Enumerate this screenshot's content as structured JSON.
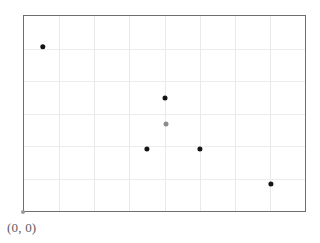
{
  "figure": {
    "origin_label": "(0, 0)",
    "background_color": "#ffffff",
    "frame_color": "#6e6e6e",
    "grid_color": "#e9e9ec",
    "origin_marker_color": "#9a9a9a"
  },
  "chart_data": {
    "type": "scatter",
    "title": "",
    "subtitle": "",
    "xlabel": "",
    "ylabel": "",
    "annotations": [
      "(0, 0)"
    ],
    "grid": true,
    "legend": false,
    "xlim": [
      0,
      8
    ],
    "ylim": [
      0,
      6
    ],
    "xticks": [
      1,
      2,
      3,
      4,
      5,
      6,
      7
    ],
    "yticks": [
      1,
      2,
      3,
      4,
      5
    ],
    "xticklabels": [],
    "yticklabels": [],
    "series": [
      {
        "name": "points",
        "marker": "circle",
        "points": [
          {
            "x": 0.54,
            "y": 5.05,
            "color": "#141414",
            "size": 5.4
          },
          {
            "x": 4.01,
            "y": 3.47,
            "color": "#141414",
            "size": 5.0
          },
          {
            "x": 4.03,
            "y": 2.67,
            "color": "#8c8c8c",
            "size": 5.0
          },
          {
            "x": 3.51,
            "y": 1.9,
            "color": "#141414",
            "size": 5.2
          },
          {
            "x": 5.01,
            "y": 1.9,
            "color": "#141414",
            "size": 5.2
          },
          {
            "x": 7.02,
            "y": 0.83,
            "color": "#141414",
            "size": 5.2
          }
        ]
      }
    ]
  }
}
